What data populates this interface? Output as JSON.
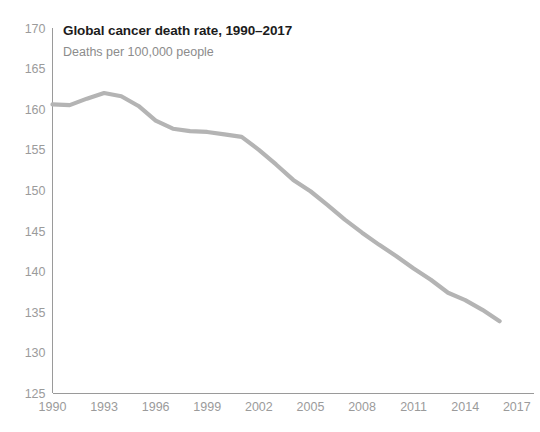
{
  "chart_data": {
    "type": "line",
    "title": "Global cancer death rate, 1990–2017",
    "subtitle": "Deaths per 100,000 people",
    "xlabel": "",
    "ylabel": "",
    "grid": false,
    "legend": "none",
    "line_color": "#b4b4b4",
    "axis_color": "#9a9a9a",
    "title_color": "#1c1c1c",
    "subtitle_color": "#8c8c8c",
    "tick_color": "#9b9b9b",
    "xlim": [
      1990,
      2018
    ],
    "ylim": [
      125,
      170
    ],
    "y_ticks": [
      125,
      130,
      135,
      140,
      145,
      150,
      155,
      160,
      165,
      170
    ],
    "x_ticks": [
      1990,
      1993,
      1996,
      1999,
      2002,
      2005,
      2008,
      2011,
      2014,
      2017
    ],
    "x": [
      1990,
      1991,
      1992,
      1993,
      1994,
      1995,
      1996,
      1997,
      1998,
      1999,
      2000,
      2001,
      2002,
      2003,
      2004,
      2005,
      2006,
      2007,
      2008,
      2009,
      2010,
      2011,
      2012,
      2013,
      2014,
      2015,
      2016
    ],
    "series": [
      {
        "name": "Global cancer death rate",
        "values": [
          160.6,
          160.5,
          161.3,
          162.0,
          161.6,
          160.4,
          158.6,
          157.6,
          157.3,
          157.2,
          156.9,
          156.6,
          155.0,
          153.2,
          151.3,
          149.9,
          148.2,
          146.4,
          144.8,
          143.3,
          141.9,
          140.4,
          139.0,
          137.4,
          136.5,
          135.3,
          133.9
        ]
      }
    ]
  },
  "axis": {
    "y_tick_labels": [
      "170",
      "165",
      "160",
      "155",
      "150",
      "145",
      "140",
      "135",
      "130",
      "125"
    ],
    "x_tick_labels": [
      "1990",
      "1993",
      "1996",
      "1999",
      "2002",
      "2005",
      "2008",
      "2011",
      "2014",
      "2017"
    ]
  }
}
